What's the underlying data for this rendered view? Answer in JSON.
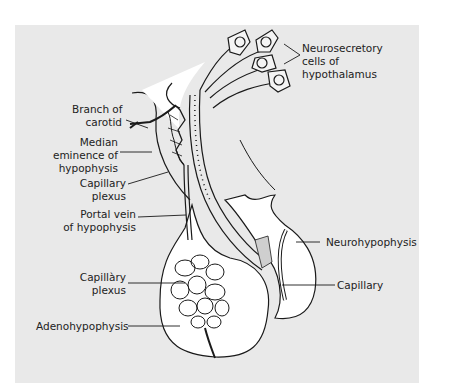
{
  "figure": {
    "background_color": "#e9e9e9",
    "line_color": "#1a1a1a",
    "fill_color": "#ffffff"
  },
  "labels": {
    "neurosecretory": {
      "lines": [
        "Neurosecretory",
        "cells of",
        "hypothalamus"
      ]
    },
    "branch_carotid": {
      "lines": [
        "Branch of",
        "carotid"
      ]
    },
    "median_eminence": {
      "lines": [
        "Median",
        "eminence of",
        "hypophysis"
      ]
    },
    "capillary_plexus_upper": {
      "lines": [
        "Capillary",
        "plexus"
      ]
    },
    "portal_vein": {
      "lines": [
        "Portal vein",
        "of hypophysis"
      ]
    },
    "capillary_plexus_lower": {
      "lines": [
        "Capillàry",
        "plexus"
      ]
    },
    "adenohypophysis": {
      "lines": [
        "Adenohypophysis"
      ]
    },
    "neurohypophysis": {
      "lines": [
        "Neurohypophysis"
      ]
    },
    "capillary": {
      "lines": [
        "Capillary"
      ]
    }
  }
}
